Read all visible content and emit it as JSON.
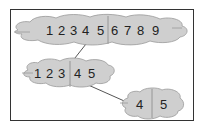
{
  "diagram": {
    "type": "tree-split",
    "colors": {
      "cloud_fill": "#cfcfcf",
      "cloud_stroke": "#9a9a9a",
      "frame": "#333333",
      "line": "#555555",
      "text": "#222222"
    },
    "nodes": [
      {
        "id": "root",
        "left": [
          "1",
          "2",
          "3",
          "4",
          "5"
        ],
        "right": [
          "6",
          "7",
          "8",
          "9"
        ]
      },
      {
        "id": "child",
        "left": [
          "1",
          "2",
          "3"
        ],
        "right": [
          "4",
          "5"
        ]
      },
      {
        "id": "grandchild",
        "left": [
          "4"
        ],
        "right": [
          "5"
        ]
      }
    ],
    "edges": [
      {
        "from": "root",
        "to": "child"
      },
      {
        "from": "child",
        "to": "grandchild"
      }
    ]
  }
}
